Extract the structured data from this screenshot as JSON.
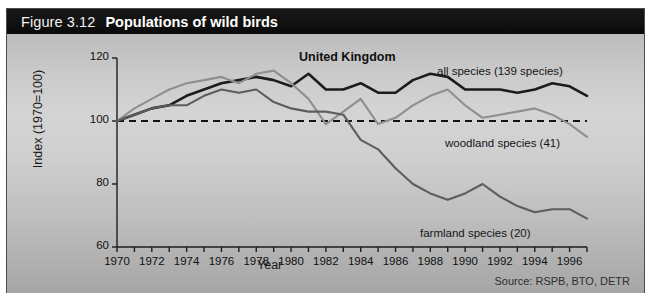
{
  "figure": {
    "number": "Figure 3.12",
    "title": "Populations of wild birds",
    "subtitle": "United Kingdom",
    "source": "Source: RSPB, BTO, DETR"
  },
  "chart_data": {
    "type": "line",
    "title": "Populations of wild birds",
    "subtitle": "United Kingdom",
    "xlabel": "Year",
    "ylabel": "Index (1970=100)",
    "xlim": [
      1970,
      1997
    ],
    "ylim": [
      60,
      120
    ],
    "yticks": [
      60,
      80,
      100,
      120
    ],
    "xticks": [
      1970,
      1972,
      1974,
      1976,
      1978,
      1980,
      1982,
      1984,
      1986,
      1988,
      1990,
      1992,
      1994,
      1996
    ],
    "xtick_labels": [
      "1970",
      "1972",
      "1974",
      "1976",
      "1978",
      "1980",
      "1982",
      "1984",
      "1986",
      "1988",
      "1990",
      "1992",
      "1994",
      "1996"
    ],
    "ytick_labels": [
      "60",
      "80",
      "100",
      "120"
    ],
    "grid": false,
    "legend": "inline-annotations",
    "reference_line": {
      "value": 100,
      "style": "dashed",
      "label": "1970=100"
    },
    "x": [
      1970,
      1971,
      1972,
      1973,
      1974,
      1975,
      1976,
      1977,
      1978,
      1979,
      1980,
      1981,
      1982,
      1983,
      1984,
      1985,
      1986,
      1987,
      1988,
      1989,
      1990,
      1991,
      1992,
      1993,
      1994,
      1995,
      1996,
      1997
    ],
    "series": [
      {
        "name": "all species (139 species)",
        "color": "#1c1c1c",
        "values": [
          100,
          102,
          104,
          105,
          108,
          110,
          112,
          113,
          114,
          113,
          111,
          115,
          110,
          110,
          112,
          109,
          109,
          113,
          115,
          114,
          110,
          110,
          110,
          109,
          110,
          112,
          111,
          108
        ]
      },
      {
        "name": "woodland species (41)",
        "color": "#8f8f8f",
        "values": [
          100,
          104,
          107,
          110,
          112,
          113,
          114,
          112,
          115,
          116,
          112,
          107,
          99,
          103,
          107,
          99,
          101,
          105,
          108,
          110,
          105,
          101,
          102,
          103,
          104,
          102,
          99,
          95
        ]
      },
      {
        "name": "farmland species (20)",
        "color": "#5d5d5d",
        "values": [
          100,
          102,
          104,
          105,
          105,
          108,
          110,
          109,
          110,
          106,
          104,
          103,
          103,
          102,
          94,
          91,
          85,
          80,
          77,
          75,
          77,
          80,
          76,
          73,
          71,
          72,
          72,
          69
        ]
      }
    ]
  },
  "annotations": [
    {
      "name": "all-species-label",
      "text": "all species (139 species)"
    },
    {
      "name": "woodland-species-label",
      "text": "woodland species (41)"
    },
    {
      "name": "farmland-species-label",
      "text": "farmland species (20)"
    }
  ]
}
